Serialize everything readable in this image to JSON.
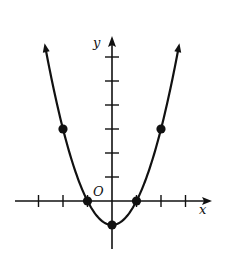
{
  "chart_data": {
    "type": "line",
    "title": "",
    "function": "y = x^2 - 1",
    "xlabel": "x",
    "ylabel": "y",
    "origin_label": "O",
    "xlim": [
      -3,
      3.3
    ],
    "ylim": [
      -1.9,
      6.5
    ],
    "grid": false,
    "legend": null,
    "x_ticks": [
      -3,
      -2,
      -1,
      1,
      2,
      3
    ],
    "y_ticks": [
      1,
      2,
      3,
      4,
      5,
      6
    ],
    "tick_labels_shown": false,
    "curve_range": [
      -2.7,
      2.7
    ],
    "arrows_on_curve_ends": true,
    "series": [
      {
        "name": "parabola",
        "x": [
          -2,
          -1,
          0,
          1,
          2
        ],
        "y": [
          3,
          0,
          -1,
          0,
          3
        ],
        "marked_points": true
      }
    ],
    "colors": {
      "ink": "#111111",
      "background": "#ffffff"
    }
  }
}
